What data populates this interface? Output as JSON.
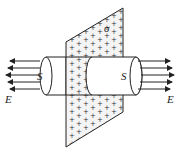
{
  "diagram": {
    "labels": {
      "surface_left": "S",
      "surface_right": "S",
      "field_left": "E",
      "field_right": "E",
      "charge_density": "σ"
    },
    "plus_symbol": "+",
    "field_lines": {
      "left_count": 5,
      "right_count": 5
    },
    "colors": {
      "stroke": "#222222",
      "background": "#ffffff"
    }
  }
}
